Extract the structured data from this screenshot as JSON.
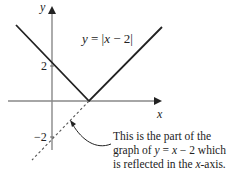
{
  "diagram": {
    "axes": {
      "x_label": "x",
      "y_label": "y",
      "y_ticks": [
        {
          "value": 2,
          "label": "2"
        },
        {
          "value": -2,
          "label": "−2"
        }
      ]
    },
    "function_label": "y = |x − 2|",
    "function_label_parts": {
      "y": "y",
      "eq": " = |",
      "x": "x",
      "rest": " − 2|"
    },
    "annotation": {
      "line1": "This is the part of the",
      "line2_pre": "graph of ",
      "line2_y": "y",
      "line2_mid": " = ",
      "line2_x": "x",
      "line2_post": " − 2 which",
      "line3_pre": "is reflected in the ",
      "line3_x": "x",
      "line3_post": "-axis."
    },
    "colors": {
      "graph": "#222222",
      "axes": "#888888",
      "dashed": "#555555",
      "text": "#222222"
    }
  }
}
